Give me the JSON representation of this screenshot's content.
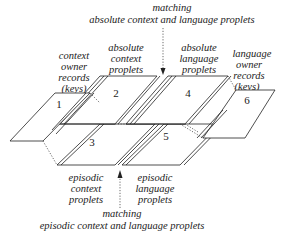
{
  "diagram": {
    "top_match": {
      "line1": "matching",
      "line2": "absolute context and language proplets"
    },
    "bottom_match": {
      "line1": "matching",
      "line2": "episodic context and language proplets"
    },
    "labels": {
      "context_owner": [
        "context",
        "owner",
        "records",
        "(keys)"
      ],
      "absolute_context": [
        "absolute",
        "context",
        "proplets"
      ],
      "absolute_language": [
        "absolute",
        "language",
        "proplets"
      ],
      "language_owner": [
        "language",
        "owner",
        "records",
        "(keys)"
      ],
      "episodic_context": [
        "episodic",
        "context",
        "proplets"
      ],
      "episodic_language": [
        "episodic",
        "language",
        "proplets"
      ]
    },
    "regions": [
      {
        "id": "1",
        "label": "1"
      },
      {
        "id": "2",
        "label": "2"
      },
      {
        "id": "3",
        "label": "3"
      },
      {
        "id": "4",
        "label": "4"
      },
      {
        "id": "5",
        "label": "5"
      },
      {
        "id": "6",
        "label": "6"
      }
    ],
    "colors": {
      "stroke": "#222222",
      "background": "#ffffff"
    }
  }
}
